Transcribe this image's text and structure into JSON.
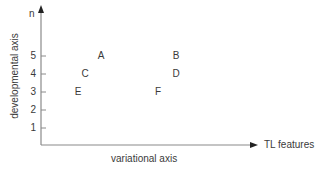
{
  "diagram": {
    "y_axis": {
      "end_label": "n",
      "title": "developmental axis",
      "ticks": [
        {
          "label": "5",
          "y": 56
        },
        {
          "label": "4",
          "y": 74
        },
        {
          "label": "3",
          "y": 92
        },
        {
          "label": "2",
          "y": 110
        },
        {
          "label": "1",
          "y": 128
        }
      ]
    },
    "x_axis": {
      "end_label": "TL features",
      "title": "variational axis"
    },
    "points": [
      {
        "label": "A",
        "x": 101,
        "y": 56
      },
      {
        "label": "B",
        "x": 176,
        "y": 56
      },
      {
        "label": "C",
        "x": 85,
        "y": 74
      },
      {
        "label": "D",
        "x": 176,
        "y": 74
      },
      {
        "label": "E",
        "x": 78,
        "y": 92
      },
      {
        "label": "F",
        "x": 158,
        "y": 92
      }
    ],
    "colors": {
      "axis": "#8a8a8a",
      "text": "#3a3a3a"
    }
  }
}
